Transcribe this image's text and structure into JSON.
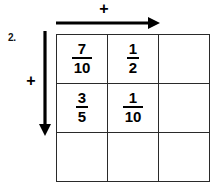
{
  "worksheet": {
    "problem_number": "2.",
    "top_operator": "+",
    "left_operator": "+",
    "top_arrow_icon": "arrow-right-icon",
    "left_arrow_icon": "arrow-down-icon",
    "grid": {
      "rows": 3,
      "columns": 3,
      "highlighted_block": "top-left 2x2",
      "cells": [
        [
          {
            "numerator": "7",
            "denominator": "10",
            "empty": false
          },
          {
            "numerator": "1",
            "denominator": "2",
            "empty": false
          },
          {
            "numerator": "",
            "denominator": "",
            "empty": true
          }
        ],
        [
          {
            "numerator": "3",
            "denominator": "5",
            "empty": false
          },
          {
            "numerator": "1",
            "denominator": "10",
            "empty": false
          },
          {
            "numerator": "",
            "denominator": "",
            "empty": true
          }
        ],
        [
          {
            "numerator": "",
            "denominator": "",
            "empty": true
          },
          {
            "numerator": "",
            "denominator": "",
            "empty": true
          },
          {
            "numerator": "",
            "denominator": "",
            "empty": true
          }
        ]
      ]
    }
  },
  "colors": {
    "background": "#ffffff",
    "ink": "#000000",
    "thin_rule": "#2a2a2a"
  }
}
